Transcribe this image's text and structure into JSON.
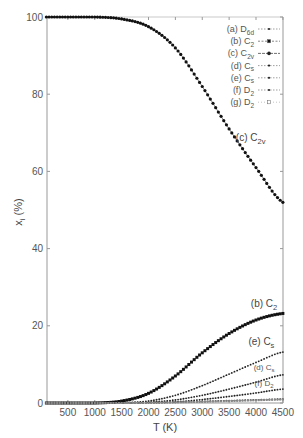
{
  "chart_data": {
    "type": "line",
    "title": "",
    "xlabel": "T (K)",
    "ylabel": "x_i (%)",
    "xlim": [
      100,
      4500
    ],
    "ylim": [
      0,
      100
    ],
    "xticks": [
      500,
      1000,
      1500,
      2000,
      2500,
      3000,
      3500,
      4000,
      4500
    ],
    "yticks": [
      0,
      20,
      40,
      60,
      80,
      100
    ],
    "grid": false,
    "legend_position": "upper right",
    "x": [
      100,
      500,
      1000,
      1500,
      2000,
      2500,
      3000,
      3500,
      4000,
      4500
    ],
    "series": [
      {
        "name": "(a) D6d",
        "label_main": "(a) D",
        "label_sub": "6d",
        "marker": "small-dot",
        "values": [
          0,
          0,
          0,
          0,
          0.1,
          0.2,
          0.4,
          0.6,
          0.8,
          1.0
        ]
      },
      {
        "name": "(b) C2",
        "label_main": "(b) C",
        "label_sub": "2",
        "marker": "square",
        "values": [
          0,
          0,
          0,
          0.5,
          2.5,
          7.0,
          13.0,
          18.0,
          21.5,
          23.2
        ]
      },
      {
        "name": "(c) C2v",
        "label_main": "(c) C",
        "label_sub": "2v",
        "marker": "circle",
        "values": [
          100,
          100,
          100,
          99.5,
          97.5,
          92.0,
          82.0,
          71.0,
          61.0,
          52.0
        ]
      },
      {
        "name": "(d) Cs",
        "label_main": "(d) C",
        "label_sub": "s",
        "marker": "small-dot",
        "values": [
          0,
          0,
          0,
          0,
          0.2,
          0.8,
          2.0,
          3.6,
          5.4,
          7.3
        ]
      },
      {
        "name": "(e) Cs",
        "label_main": "(e) C",
        "label_sub": "s",
        "marker": "small-dot",
        "values": [
          0,
          0,
          0,
          0.1,
          0.5,
          2.0,
          4.5,
          7.5,
          10.5,
          13.2
        ]
      },
      {
        "name": "(f) D2",
        "label_main": "(f) D",
        "label_sub": "2",
        "marker": "small-dot",
        "values": [
          0,
          0,
          0,
          0,
          0.1,
          0.3,
          0.9,
          1.7,
          2.6,
          3.6
        ]
      },
      {
        "name": "(g) D2",
        "label_main": "(g) D",
        "label_sub": "2",
        "marker": "open-square",
        "values": [
          0,
          0,
          0,
          0,
          0.05,
          0.15,
          0.3,
          0.5,
          0.7,
          0.9
        ]
      }
    ],
    "annotations": [
      {
        "text_main": "(c) C",
        "text_sub": "2v",
        "x": 3900,
        "y": 68
      },
      {
        "text_main": "(b) C",
        "text_sub": "2",
        "x": 4150,
        "y": 25
      },
      {
        "text_main": "(e) C",
        "text_sub": "s",
        "x": 4100,
        "y": 15
      },
      {
        "text_main": "(d) C",
        "text_sub": "s",
        "x": 4150,
        "y": 8.5
      },
      {
        "text_main": "(f) D",
        "text_sub": "2",
        "x": 4150,
        "y": 4.5
      }
    ]
  }
}
